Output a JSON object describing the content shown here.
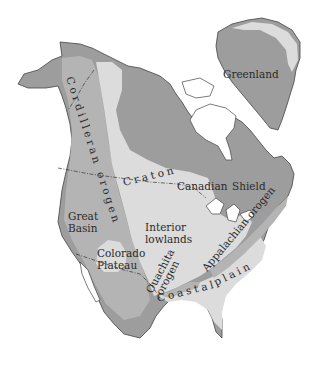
{
  "map": {
    "title": "North America geologic provinces",
    "colors": {
      "shield": "#9d9d9d",
      "orogen": "#b0b0b0",
      "lowlands": "#dcdcdc",
      "outline": "#444444",
      "background": "#ffffff"
    },
    "labels": {
      "greenland": "Greenland",
      "cordilleran_orogen": "Cordilleran orogen",
      "craton": "Craton",
      "canadian": "Canadian",
      "shield": "Shield",
      "great": "Great",
      "basin": "Basin",
      "interior": "Interior",
      "lowlands": "lowlands",
      "colorado": "Colorado",
      "plateau": "Plateau",
      "ouachita": "Ouachita",
      "orogen": "orogen",
      "appalachian_orogen": "Appalachian orogen",
      "coastal": "Coastal",
      "plain": "plain"
    }
  }
}
